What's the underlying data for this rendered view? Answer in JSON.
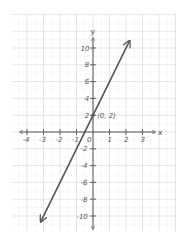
{
  "chart_data": {
    "type": "line",
    "title": "",
    "xlabel": "x",
    "ylabel": "y",
    "xlim": [
      -4.9,
      5.0
    ],
    "ylim": [
      -11.9,
      14.0
    ],
    "grid": true,
    "legend": null,
    "x_ticks": [
      -4,
      -3,
      -2,
      -1,
      0,
      1,
      2,
      3
    ],
    "x_tick_labels": [
      "-4",
      "-3",
      "-2",
      "-1",
      "0",
      "1",
      "2",
      "3"
    ],
    "y_ticks": [
      10,
      8,
      6,
      4,
      2,
      -2,
      -4,
      -6,
      -8,
      -10
    ],
    "y_tick_labels": [
      "10",
      "8",
      "6",
      "4",
      "2",
      "-2",
      "-4",
      "-6",
      "-8",
      "-10"
    ],
    "series": [
      {
        "name": "y = 4x + 2",
        "equation": "y = 4x + 2",
        "x": [
          -3.15,
          2.2
        ],
        "y": [
          -10.6,
          10.8
        ],
        "arrows": "both",
        "color": "#555555"
      }
    ],
    "annotations": [
      {
        "text": "(0, 2)",
        "x": 0,
        "y": 2,
        "marker": "point"
      }
    ]
  },
  "colors": {
    "grid_major": "#d9d9d9",
    "grid_minor": "#eeeeee",
    "axis": "#555555",
    "line": "#555555",
    "background": "#ffffff"
  }
}
